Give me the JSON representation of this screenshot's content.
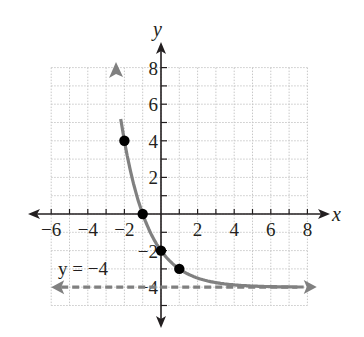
{
  "chart_data": {
    "type": "line",
    "title": "",
    "xlabel": "x",
    "ylabel": "y",
    "xlim": [
      -6,
      8
    ],
    "ylim": [
      -5,
      8
    ],
    "grid": true,
    "x_ticks": [
      -6,
      -4,
      -2,
      2,
      4,
      6,
      8
    ],
    "y_ticks": [
      8,
      6,
      4,
      2,
      -2,
      -4
    ],
    "x_tick_labels": [
      "−6",
      "−4",
      "−2",
      "2",
      "4",
      "6",
      "8"
    ],
    "y_tick_labels": [
      "8",
      "6",
      "4",
      "2",
      "−2",
      "−4"
    ],
    "series": [
      {
        "name": "y = 2^(1−x) − 4",
        "kind": "curve",
        "color": "#808080",
        "x_range": [
          -2.2,
          7.8
        ],
        "arrows": "both"
      },
      {
        "name": "asymptote",
        "kind": "dashed-line",
        "color": "#808080",
        "y": -4,
        "x_range": [
          -6,
          8
        ],
        "arrows": "both"
      }
    ],
    "points": [
      {
        "x": -2,
        "y": 4
      },
      {
        "x": -1,
        "y": 0
      },
      {
        "x": 0,
        "y": -2
      },
      {
        "x": 1,
        "y": -3
      }
    ],
    "annotations": [
      {
        "text": "y = −4",
        "x": -5.5,
        "y": -3.4
      }
    ]
  },
  "labels": {
    "x_axis": "x",
    "y_axis": "y",
    "asymptote_label": "y = −4"
  },
  "colors": {
    "axis": "#231f20",
    "curve": "#808080",
    "grid": "#c8c8c8",
    "point": "#000000"
  }
}
